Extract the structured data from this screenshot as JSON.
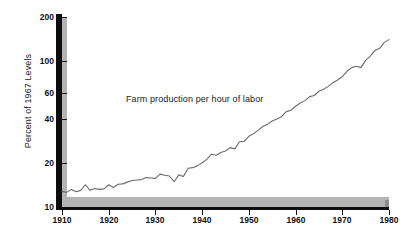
{
  "chart_data": {
    "type": "line",
    "title": "",
    "subtitle": "",
    "xlabel": "",
    "ylabel": "Percent of 1967 Levels",
    "yscale": "log",
    "xlim": [
      1910,
      1980
    ],
    "ylim": [
      10,
      200
    ],
    "grid": false,
    "legend_position": "none",
    "annotations": [
      {
        "text": "Farm production per hour of labor",
        "x": 1936,
        "y": 48
      }
    ],
    "x_ticks": [
      1910,
      1920,
      1930,
      1940,
      1950,
      1960,
      1970,
      1980
    ],
    "x_tick_labels": [
      "1910",
      "1920",
      "1930",
      "1940",
      "1950",
      "1960",
      "1970",
      "1980"
    ],
    "y_ticks": [
      10,
      20,
      40,
      60,
      100,
      200
    ],
    "y_tick_labels": [
      "10",
      "20",
      "40",
      "60",
      "100",
      "200"
    ],
    "series": [
      {
        "name": "Farm production per hour of labor",
        "color": "#6b6b6b",
        "x": [
          1910,
          1911,
          1912,
          1913,
          1914,
          1915,
          1916,
          1917,
          1918,
          1919,
          1920,
          1921,
          1922,
          1923,
          1924,
          1925,
          1926,
          1927,
          1928,
          1929,
          1930,
          1931,
          1932,
          1933,
          1934,
          1935,
          1936,
          1937,
          1938,
          1939,
          1940,
          1941,
          1942,
          1943,
          1944,
          1945,
          1946,
          1947,
          1948,
          1949,
          1950,
          1951,
          1952,
          1953,
          1954,
          1955,
          1956,
          1957,
          1958,
          1959,
          1960,
          1961,
          1962,
          1963,
          1964,
          1965,
          1966,
          1967,
          1968,
          1969,
          1970,
          1971,
          1972,
          1973,
          1974,
          1975,
          1976,
          1977,
          1978,
          1979,
          1980
        ],
        "y": [
          12.8,
          12.6,
          13.2,
          12.7,
          13.0,
          14.2,
          13.0,
          13.4,
          13.2,
          13.3,
          14.2,
          13.6,
          14.3,
          14.4,
          14.8,
          15.2,
          15.3,
          15.4,
          15.9,
          15.8,
          15.7,
          16.8,
          16.5,
          16.3,
          14.9,
          16.6,
          16.2,
          18.4,
          18.6,
          19.2,
          20.1,
          21.2,
          23.0,
          22.6,
          23.6,
          24.2,
          25.5,
          25.0,
          28.0,
          28.2,
          30.5,
          31.8,
          33.6,
          35.6,
          36.8,
          38.8,
          40.0,
          41.5,
          45.0,
          46.0,
          49.0,
          51.5,
          53.5,
          57.0,
          58.0,
          62.0,
          64.0,
          67.0,
          71.0,
          74.0,
          78.0,
          85.0,
          90.0,
          92.0,
          90.0,
          101.0,
          108.0,
          118.0,
          122.0,
          134.0,
          140.0
        ]
      }
    ]
  }
}
